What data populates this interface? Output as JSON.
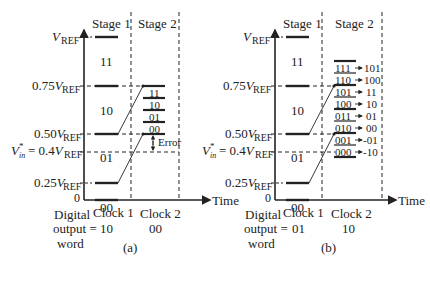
{
  "panels": [
    {
      "id": "a",
      "caption": "(a)",
      "stage1_label": "Stage 1",
      "stage2_label": "Stage 2",
      "y_labels": {
        "vref": "V",
        "vref_sub": "REF",
        "v075": "0.75V",
        "v075_sub": "REF",
        "v050": "0.50V",
        "v050_sub": "REF",
        "vin": "V",
        "vin_sub": "in",
        "vin_sup": "*",
        "vin_rest": " = 0.4V",
        "vin_rest_sub": "REF",
        "v025": "0.25V",
        "v025_sub": "REF",
        "zero": "0"
      },
      "stage1_codes": [
        "11",
        "10",
        "01",
        "00"
      ],
      "stage2_codes": [
        "11",
        "10",
        "01",
        "00"
      ],
      "error_label": "Error",
      "clock1": "Clock 1",
      "clock2": "Clock 2",
      "digital_label": [
        "Digital",
        "output =",
        "word"
      ],
      "output1": "10",
      "output2": "00",
      "time_label": "Time"
    },
    {
      "id": "b",
      "caption": "(b)",
      "stage1_label": "Stage 1",
      "stage2_label": "Stage 2",
      "stage1_codes": [
        "11",
        "10",
        "01",
        "00"
      ],
      "stage2_codes": [
        {
          "code": "111",
          "mapped": "101"
        },
        {
          "code": "110",
          "mapped": "100"
        },
        {
          "code": "101",
          "mapped": "11"
        },
        {
          "code": "100",
          "mapped": "10"
        },
        {
          "code": "011",
          "mapped": "01"
        },
        {
          "code": "010",
          "mapped": "00"
        },
        {
          "code": "001",
          "mapped": "-01"
        },
        {
          "code": "000",
          "mapped": "-10"
        }
      ],
      "clock1": "Clock 1",
      "clock2": "Clock 2",
      "digital_label": [
        "Digital",
        "output =",
        "word"
      ],
      "output1": "01",
      "output2": "10",
      "time_label": "Time"
    }
  ]
}
